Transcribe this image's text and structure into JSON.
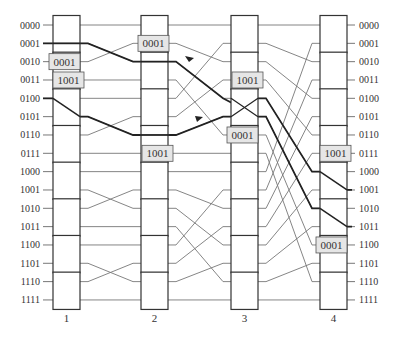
{
  "diagram": {
    "type": "butterfly-network",
    "rows": [
      "0000",
      "0001",
      "0010",
      "0011",
      "0100",
      "0101",
      "0110",
      "0111",
      "1000",
      "1001",
      "1010",
      "1011",
      "1100",
      "1101",
      "1110",
      "1111"
    ],
    "stages": [
      {
        "label": "1",
        "box_x": 53
      },
      {
        "label": "2",
        "box_x": 141
      },
      {
        "label": "3",
        "box_x": 231
      },
      {
        "label": "4",
        "box_x": 320
      }
    ],
    "connections": [
      {
        "from_stage": 1,
        "to_stage": 2,
        "map": [
          0,
          2,
          1,
          3,
          4,
          6,
          5,
          7,
          8,
          10,
          9,
          11,
          12,
          14,
          13,
          15
        ]
      },
      {
        "from_stage": 2,
        "to_stage": 3,
        "map": [
          0,
          2,
          4,
          6,
          1,
          3,
          5,
          7,
          8,
          10,
          12,
          14,
          9,
          11,
          13,
          15
        ]
      },
      {
        "from_stage": 3,
        "to_stage": 4,
        "map": [
          0,
          2,
          4,
          6,
          8,
          10,
          12,
          14,
          1,
          3,
          5,
          7,
          9,
          11,
          13,
          15
        ]
      }
    ],
    "highlighted_paths": [
      {
        "name": "path-0001-to-1001",
        "points": [
          [
            1,
            0
          ],
          [
            1,
            "cross"
          ],
          [
            2,
            2
          ],
          [
            3,
            4
          ],
          [
            4,
            8
          ],
          [
            4,
            "out",
            9
          ]
        ]
      },
      {
        "name": "path-0100-to-1011",
        "points": [
          [
            4,
            0
          ],
          [
            5,
            "cross"
          ],
          [
            6,
            2
          ],
          [
            5,
            3
          ],
          [
            10,
            4
          ],
          [
            4,
            "out",
            11
          ]
        ]
      }
    ],
    "crossed_switch": {
      "stage": 3,
      "rows": [
        4,
        5
      ]
    },
    "tags": [
      {
        "text": "0001",
        "stage": 1,
        "row": 2
      },
      {
        "text": "1001",
        "stage": 1,
        "row": 3
      },
      {
        "text": "0001",
        "stage": 2,
        "row": 1
      },
      {
        "text": "1001",
        "stage": 2,
        "row": 7
      },
      {
        "text": "1001",
        "stage": 3,
        "row": 3
      },
      {
        "text": "0001",
        "stage": 3,
        "row": 6
      },
      {
        "text": "1001",
        "stage": 4,
        "row": 7
      },
      {
        "text": "0001",
        "stage": 4,
        "row": 12
      }
    ],
    "colors": {
      "line": "#777777",
      "bold": "#222222",
      "box": "#333333",
      "tag_fill": "#e6e6e6"
    }
  }
}
